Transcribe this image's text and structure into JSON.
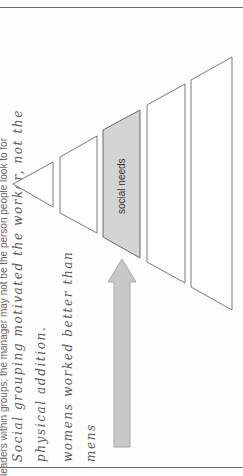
{
  "page": {
    "printed_line": "leaders within groups; the manager may not be the person people look to for",
    "handwritten_notes": [
      "Social grouping motivated the worker, not the",
      "physical addition.",
      "womens worked better than",
      "mens"
    ]
  },
  "diagram": {
    "type": "hierarchy-pyramid",
    "levels": [
      {
        "label": "",
        "highlighted": false
      },
      {
        "label": "",
        "highlighted": false
      },
      {
        "label": "social needs",
        "highlighted": true
      },
      {
        "label": "",
        "highlighted": false
      },
      {
        "label": "",
        "highlighted": false
      }
    ],
    "highlight_color": "#d4d4d4",
    "arrow": {
      "direction": "toward social needs",
      "color": "#c8c8c8"
    }
  }
}
